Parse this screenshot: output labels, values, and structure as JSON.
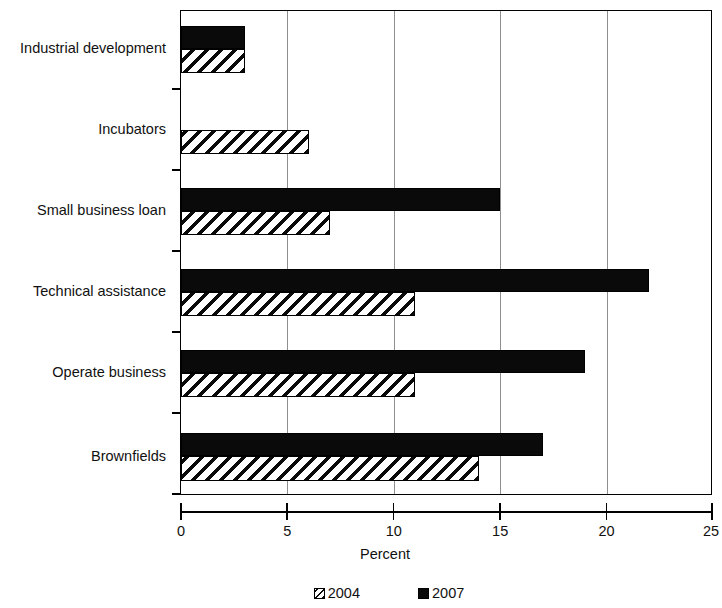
{
  "chart_data": {
    "type": "bar",
    "orientation": "horizontal",
    "title": "",
    "xlabel": "Percent",
    "ylabel": "",
    "xlim": [
      0,
      25
    ],
    "xticks": [
      0,
      5,
      10,
      15,
      20,
      25
    ],
    "xtick_labels": [
      "0",
      "5",
      "10",
      "15",
      "20",
      "25"
    ],
    "grid": true,
    "grid_axis": "x",
    "legend_position": "bottom",
    "categories": [
      "Industrial development",
      "Incubators",
      "Small business loan",
      "Technical assistance",
      "Operate business",
      "Brownfields"
    ],
    "series": [
      {
        "name": "2004",
        "fill": "diagonal-hatch",
        "color": "#000000",
        "values": [
          3,
          6,
          7,
          11,
          11,
          14
        ]
      },
      {
        "name": "2007",
        "fill": "solid",
        "color": "#000000",
        "values": [
          3,
          0,
          15,
          22,
          19,
          17
        ]
      }
    ]
  },
  "legend": {
    "items": [
      {
        "label": "2004",
        "swatch": "hatched-swatch"
      },
      {
        "label": "2007",
        "swatch": "solid-black-swatch"
      }
    ]
  },
  "axis": {
    "x_title": "Percent"
  }
}
